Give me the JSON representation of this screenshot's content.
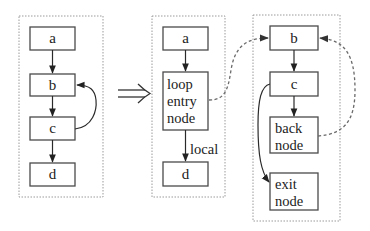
{
  "diagram": {
    "transform_symbol": "⇒",
    "left_graph": {
      "nodes": [
        {
          "id": "a",
          "label": "a"
        },
        {
          "id": "b",
          "label": "b"
        },
        {
          "id": "c",
          "label": "c"
        },
        {
          "id": "d",
          "label": "d"
        }
      ],
      "edges": [
        {
          "from": "a",
          "to": "b",
          "style": "solid"
        },
        {
          "from": "b",
          "to": "c",
          "style": "solid"
        },
        {
          "from": "c",
          "to": "d",
          "style": "solid"
        },
        {
          "from": "c",
          "to": "b",
          "style": "solid",
          "kind": "back-edge"
        }
      ]
    },
    "middle_graph": {
      "nodes": [
        {
          "id": "a",
          "label": "a"
        },
        {
          "id": "loop_entry",
          "label_lines": [
            "loop",
            "entry",
            "node"
          ]
        },
        {
          "id": "d",
          "label": "d"
        }
      ],
      "edges": [
        {
          "from": "a",
          "to": "loop_entry",
          "style": "solid"
        },
        {
          "from": "loop_entry",
          "to": "d",
          "style": "solid",
          "label": "local"
        }
      ]
    },
    "right_graph": {
      "nodes": [
        {
          "id": "b",
          "label": "b"
        },
        {
          "id": "c",
          "label": "c"
        },
        {
          "id": "back_node",
          "label_lines": [
            "back",
            "node"
          ]
        },
        {
          "id": "exit_node",
          "label_lines": [
            "exit",
            "node"
          ]
        }
      ],
      "edges": [
        {
          "from": "b",
          "to": "c",
          "style": "solid"
        },
        {
          "from": "c",
          "to": "back_node",
          "style": "solid"
        },
        {
          "from": "c",
          "to": "exit_node",
          "style": "solid"
        },
        {
          "from": "back_node",
          "to": "b",
          "style": "dashed"
        }
      ]
    },
    "cross_edges": [
      {
        "from": "middle.loop_entry",
        "to": "right.b",
        "style": "dashed"
      }
    ]
  }
}
